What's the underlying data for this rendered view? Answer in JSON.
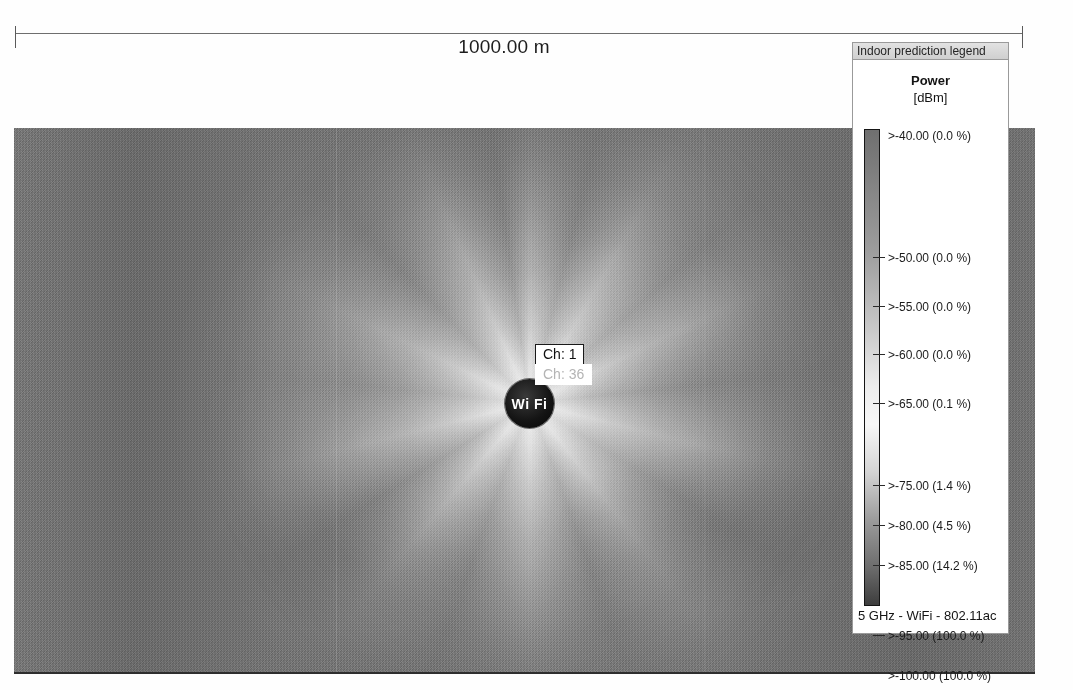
{
  "scale": {
    "label": "1000.00 m"
  },
  "map": {
    "ap": {
      "icon_label": "Wi Fi",
      "channel_primary": "Ch: 1",
      "channel_secondary": "Ch: 36"
    }
  },
  "legend": {
    "title": "Indoor prediction legend",
    "heading": "Power",
    "unit": "[dBm]",
    "footer": "5 GHz - WiFi - 802.11ac",
    "entries": [
      {
        "label": ">-40.00 (0.0 %)",
        "threshold": -40,
        "percent": "0.0 %",
        "pos": 0
      },
      {
        "label": ">-50.00 (0.0 %)",
        "threshold": -50,
        "percent": "0.0 %",
        "pos": 122
      },
      {
        "label": ">-55.00 (0.0 %)",
        "threshold": -55,
        "percent": "0.0 %",
        "pos": 171
      },
      {
        "label": ">-60.00 (0.0 %)",
        "threshold": -60,
        "percent": "0.0 %",
        "pos": 219
      },
      {
        "label": ">-65.00 (0.1 %)",
        "threshold": -65,
        "percent": "0.1 %",
        "pos": 268
      },
      {
        "label": ">-75.00 (1.4 %)",
        "threshold": -75,
        "percent": "1.4 %",
        "pos": 350
      },
      {
        "label": ">-80.00 (4.5 %)",
        "threshold": -80,
        "percent": "4.5 %",
        "pos": 390
      },
      {
        "label": ">-85.00 (14.2 %)",
        "threshold": -85,
        "percent": "14.2 %",
        "pos": 430
      },
      {
        "label": ">-95.00 (100.0 %)",
        "threshold": -95,
        "percent": "100.0 %",
        "pos": 500
      },
      {
        "label": ">-100.00 (100.0 %)",
        "threshold": -100,
        "percent": "100.0 %",
        "pos": 540
      }
    ],
    "gradient_stops": [
      {
        "pos": "0%",
        "color": "#6f6f6f"
      },
      {
        "pos": "8%",
        "color": "#7d7d7d"
      },
      {
        "pos": "26%",
        "color": "#9e9e9e"
      },
      {
        "pos": "42%",
        "color": "#c9c9c9"
      },
      {
        "pos": "54%",
        "color": "#ededed"
      },
      {
        "pos": "62%",
        "color": "#f7f7f7"
      },
      {
        "pos": "72%",
        "color": "#d4d4d4"
      },
      {
        "pos": "82%",
        "color": "#9c9c9c"
      },
      {
        "pos": "92%",
        "color": "#6d6d6d"
      },
      {
        "pos": "100%",
        "color": "#3d3d3d"
      }
    ]
  }
}
